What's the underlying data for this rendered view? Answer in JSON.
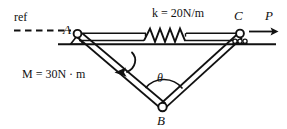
{
  "figure": {
    "type": "engineering-mechanics-free-body-diagram"
  },
  "labels": {
    "ref": "ref",
    "point_a": "A",
    "point_b": "B",
    "point_c": "C",
    "theta": "θ",
    "force_p": "P",
    "spring_k": "k = 20N/m",
    "moment_m": "M = 30N · m"
  },
  "spring": {
    "symbol_k": "k",
    "equals": "=",
    "value": "20",
    "unit": "N/m",
    "full": "k = 20N/m"
  },
  "moment": {
    "symbol_m": "M",
    "equals": "=",
    "value": "30",
    "unit": "N · m",
    "full": "M = 30N · m",
    "sense": "counterclockwise"
  },
  "geometry": {
    "a": {
      "x": 77,
      "y": 35
    },
    "b": {
      "x": 163,
      "y": 107
    },
    "c": {
      "x": 240,
      "y": 35
    },
    "ground_y": 44,
    "ref_line_y": 30,
    "ref_line_x_start": 14,
    "ref_line_x_end": 70
  },
  "supports": {
    "a_type": "pin",
    "c_type": "roller"
  },
  "colors": {
    "stroke": "#111111",
    "background": "#ffffff"
  }
}
